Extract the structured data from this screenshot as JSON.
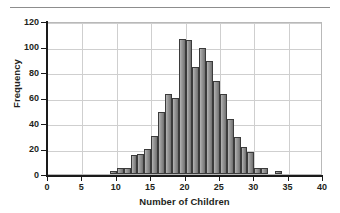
{
  "figure": {
    "has_top_rule": true,
    "background": "#ffffff"
  },
  "axes": {
    "y_title": "Frequency",
    "x_title": "Number of Children",
    "y_ticks": [
      0,
      20,
      40,
      60,
      80,
      100,
      120
    ],
    "x_ticks": [
      0,
      5,
      10,
      15,
      20,
      25,
      30,
      35,
      40
    ],
    "y_tick_labels": [
      "0",
      "20",
      "40",
      "60",
      "80",
      "100",
      "120"
    ],
    "x_tick_labels": [
      "0",
      "5",
      "10",
      "15",
      "20",
      "25",
      "30",
      "35",
      "40"
    ]
  },
  "style": {
    "bar_fill_light": "#b5b5b5",
    "bar_fill_dark": "#6f6f6f",
    "bar_stroke": "#3b3b3b",
    "gridline_color": "#cfcfcf",
    "axis_color": "#1a1a1a",
    "text_color": "#231f20"
  },
  "chart_data": {
    "type": "bar",
    "title": "",
    "subtitle": "",
    "xlabel": "Number of Children",
    "ylabel": "Frequency",
    "xlim": [
      0,
      40
    ],
    "ylim": [
      0,
      120
    ],
    "xtick_step": 5,
    "ytick_step": 20,
    "grid": true,
    "legend": null,
    "bin_width": 1,
    "categories": [
      9,
      10,
      11,
      12,
      13,
      14,
      15,
      16,
      17,
      18,
      19,
      20,
      21,
      22,
      23,
      24,
      25,
      26,
      27,
      28,
      29,
      30,
      31,
      33
    ],
    "values": [
      2,
      5,
      5,
      15,
      16,
      20,
      30,
      49,
      63,
      60,
      106,
      105,
      84,
      99,
      89,
      73,
      63,
      43,
      29,
      21,
      17,
      5,
      5,
      2
    ],
    "annotations": []
  }
}
